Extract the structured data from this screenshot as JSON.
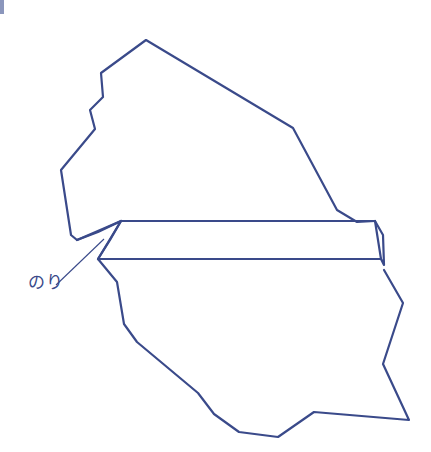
{
  "diagram": {
    "label_glue": "のり",
    "stroke_color": "#3a4a8a",
    "parts": [
      "upper-piece",
      "lower-piece",
      "glue-flap",
      "band"
    ]
  }
}
